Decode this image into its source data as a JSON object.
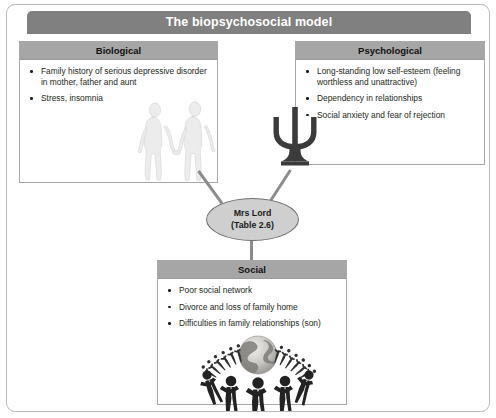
{
  "figure": {
    "title": "The biopsychosocial model"
  },
  "panels": {
    "biological": {
      "heading": "Biological",
      "items": [
        "Family history of serious  depressive disorder in mother,  father and aunt",
        "Stress, insomnia"
      ],
      "artwork": "couple-holding-hands-illustration"
    },
    "psychological": {
      "heading": "Psychological",
      "items": [
        "Long-standing low self-esteem (feeling worthless and unattractive)",
        "Dependency in relationships",
        "Social anxiety and fear of rejection"
      ],
      "artwork": "psi-symbol-illustration"
    },
    "social": {
      "heading": "Social",
      "items": [
        "Poor social network",
        "Divorce and loss of family home",
        "Difficulties in family relationships (son)"
      ],
      "artwork": "people-around-globe-illustration"
    }
  },
  "center": {
    "line1": "Mrs Lord",
    "line2": "(Table 2.6)"
  },
  "colors": {
    "title_bar": "#808080",
    "panel_header": "#a6a6a6",
    "panel_border": "#a8a8a8",
    "connector": "#8c8c8c",
    "ellipse_fill": "#cfcfcf",
    "ellipse_border": "#6f6f6f",
    "text": "#231f20"
  }
}
